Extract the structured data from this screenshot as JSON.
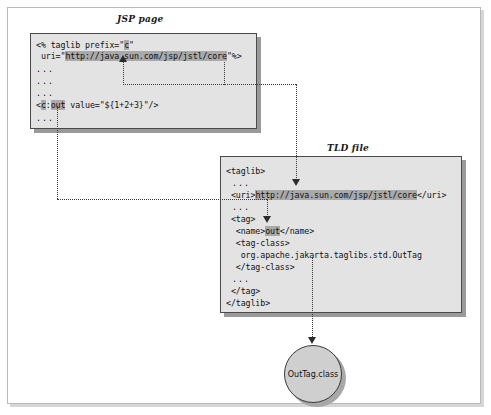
{
  "diagram": {
    "jsp_panel": {
      "label": "JSP page",
      "lines": [
        "<% taglib prefix=\"c\"",
        " uri=\"http://java.sun.com/jsp/jstl/core\"%>",
        "...",
        "...",
        "...",
        "<c:out value=\"${1+2+3}\"/>",
        "..."
      ],
      "line1_prefix": "<% taglib prefix=\"",
      "line1_highlight": "c",
      "line1_suffix": "\"",
      "line2_prefix": " uri=\"",
      "line2_highlight": "http://java.sun.com/jsp/jstl/core",
      "line2_suffix": "\"%>",
      "ellipsis": "...",
      "line6_prefix": "<",
      "line6_highlight_a": "c",
      "line6_mid": ":",
      "line6_highlight_b": "out",
      "line6_suffix": " value=\"${1+2+3}\"/>"
    },
    "tld_panel": {
      "label": "TLD file",
      "line_taglib_open": "<taglib>",
      "ellipsis": "...",
      "line_uri_prefix": " <uri>",
      "line_uri_highlight": "http://java.sun.com/jsp/jstl/core",
      "line_uri_suffix": "</uri>",
      "line_tag_open": " <tag>",
      "line_name_prefix": "  <name>",
      "line_name_highlight": "out",
      "line_name_suffix": "</name>",
      "line_tagclass_open": "  <tag-class>",
      "line_tagclass_value": "   org.apache.jakarta.taglibs.std.OutTag",
      "line_tagclass_close": "  </tag-class>",
      "line_tag_close": " </tag>",
      "line_taglib_close": "</taglib>"
    },
    "class_node": {
      "label": "OutTag.class"
    },
    "colors": {
      "panel_fill": "#e3e3e3",
      "panel_border": "#4a4a4a",
      "highlight": "#a9a9a9",
      "connector": "#3a3a3a",
      "circle_fill": "#cfcfcf",
      "frame_border": "#b9b9b9"
    }
  }
}
